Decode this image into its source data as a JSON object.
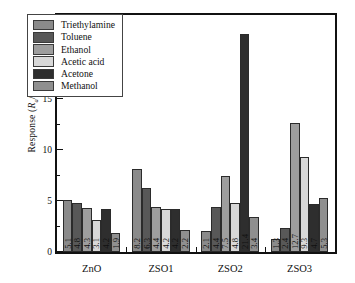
{
  "chart_data": {
    "type": "bar",
    "title": "",
    "xlabel": "",
    "ylabel": "Response (Ra/Rg)",
    "ylabel_parts": {
      "main": "Response (",
      "r1": "R",
      "sub1": "a",
      "slash": "/",
      "r2": "R",
      "sub2": "g",
      "close": ")"
    },
    "categories": [
      "ZnO",
      "ZSO1",
      "ZSO2",
      "ZSO3"
    ],
    "series": [
      {
        "name": "Triethylamine",
        "color": "#8a8a8a",
        "values": [
          5.1,
          8.2,
          2.1,
          1.3
        ]
      },
      {
        "name": "Toluene",
        "color": "#585858",
        "values": [
          4.8,
          6.3,
          4.4,
          2.4
        ]
      },
      {
        "name": "Ethanol",
        "color": "#9e9e9e",
        "values": [
          4.3,
          4.4,
          7.5,
          12.7
        ]
      },
      {
        "name": "Acetic acid",
        "color": "#d8d8d8",
        "values": [
          3.1,
          4.2,
          4.8,
          9.3
        ]
      },
      {
        "name": "Acetone",
        "color": "#2e2e2e",
        "values": [
          4.2,
          4.2,
          21.4,
          4.7
        ]
      },
      {
        "name": "Methanol",
        "color": "#8f8f8f",
        "values": [
          1.9,
          2.2,
          3.4,
          5.3
        ]
      }
    ],
    "ylim": [
      0,
      23.2
    ],
    "yticks_major": [
      0,
      5,
      10,
      15,
      20
    ],
    "yticks_minor": [
      2.5,
      7.5,
      12.5,
      17.5,
      22.5
    ],
    "grid": false,
    "legend_position": "upper left",
    "bar_value_labels": true,
    "bar_value_label_orientation": "vertical"
  },
  "legend": {
    "items": [
      {
        "label": "Triethylamine"
      },
      {
        "label": "Toluene"
      },
      {
        "label": "Ethanol"
      },
      {
        "label": "Acetic acid"
      },
      {
        "label": "Acetone"
      },
      {
        "label": "Methanol"
      }
    ]
  }
}
